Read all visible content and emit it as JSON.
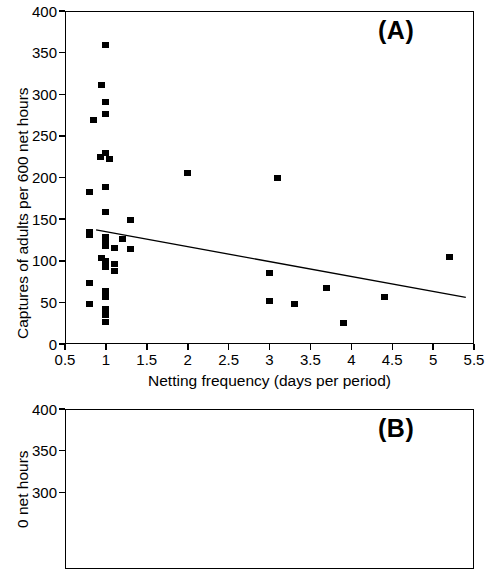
{
  "figure": {
    "panel_a_label": "(A)",
    "panel_b_label": "(B)"
  },
  "chart_data": [
    {
      "type": "scatter",
      "panel": "(A)",
      "title": "",
      "xlabel": "Netting frequency (days per period)",
      "ylabel": "Captures of adults per 600 net hours",
      "xlim": [
        0.5,
        5.5
      ],
      "ylim": [
        0,
        400
      ],
      "xticks": [
        0.5,
        1,
        1.5,
        2,
        2.5,
        3,
        3.5,
        4,
        4.5,
        5,
        5.5
      ],
      "xtick_labels": [
        "0.5",
        "1",
        "1.5",
        "2",
        "2.5",
        "3",
        "3.5",
        "4",
        "4.5",
        "5",
        "5.5"
      ],
      "yticks": [
        0,
        50,
        100,
        150,
        200,
        250,
        300,
        350,
        400
      ],
      "ytick_labels": [
        "0",
        "50",
        "100",
        "150",
        "200",
        "250",
        "300",
        "350",
        "400"
      ],
      "grid": false,
      "legend": "none",
      "marker": "filled-square",
      "points": [
        [
          1.0,
          359
        ],
        [
          0.95,
          311
        ],
        [
          1.0,
          291
        ],
        [
          1.0,
          276
        ],
        [
          0.85,
          269
        ],
        [
          1.0,
          229
        ],
        [
          0.93,
          225
        ],
        [
          1.05,
          222
        ],
        [
          1.0,
          188
        ],
        [
          0.8,
          183
        ],
        [
          1.0,
          158
        ],
        [
          1.3,
          149
        ],
        [
          0.8,
          135
        ],
        [
          0.8,
          131
        ],
        [
          1.0,
          128
        ],
        [
          1.2,
          126
        ],
        [
          1.0,
          122
        ],
        [
          1.0,
          118
        ],
        [
          1.1,
          115
        ],
        [
          1.3,
          114
        ],
        [
          0.95,
          103
        ],
        [
          1.0,
          100
        ],
        [
          1.0,
          97
        ],
        [
          1.1,
          96
        ],
        [
          1.0,
          92
        ],
        [
          1.1,
          88
        ],
        [
          0.8,
          73
        ],
        [
          1.0,
          64
        ],
        [
          1.0,
          56
        ],
        [
          0.8,
          48
        ],
        [
          1.0,
          42
        ],
        [
          1.0,
          35
        ],
        [
          1.0,
          27
        ],
        [
          2.0,
          205
        ],
        [
          3.1,
          200
        ],
        [
          3.0,
          85
        ],
        [
          3.0,
          52
        ],
        [
          3.3,
          48
        ],
        [
          3.7,
          67
        ],
        [
          3.9,
          25
        ],
        [
          4.4,
          56
        ],
        [
          5.2,
          104
        ]
      ],
      "trendline": {
        "label": "regression line",
        "x_start": 0.88,
        "y_start": 137,
        "x_end": 5.4,
        "y_end": 56
      }
    },
    {
      "type": "scatter",
      "panel": "(B)",
      "title": "",
      "xlabel": "",
      "ylabel": "0 net hours",
      "ylim": [
        0,
        400
      ],
      "yticks": [
        300,
        350,
        400
      ],
      "ytick_labels": [
        "300",
        "350",
        "400"
      ],
      "grid": false,
      "legend": "none",
      "note": "panel cropped at image bottom edge; no data points visible",
      "points": []
    }
  ]
}
